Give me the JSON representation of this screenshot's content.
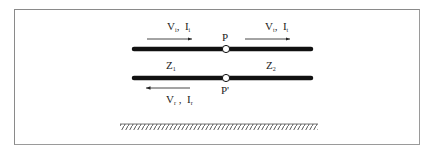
{
  "diagram": {
    "type": "transmission-line junction",
    "node_top": "P",
    "node_bottom": "P'",
    "incident": {
      "voltage": "V",
      "voltage_sub": "i",
      "current": "I",
      "current_sub": "i",
      "direction": "right"
    },
    "transmitted": {
      "voltage": "V",
      "voltage_sub": "t",
      "current": "I",
      "current_sub": "t",
      "direction": "right"
    },
    "reflected": {
      "voltage": "V",
      "voltage_sub": "r",
      "current": "I",
      "current_sub": "r",
      "direction": "left"
    },
    "impedance_left": {
      "symbol": "Z",
      "sub": "1"
    },
    "impedance_right": {
      "symbol": "Z",
      "sub": "2"
    },
    "ground": "hatched ground plane",
    "colors": {
      "conductor": "#111111",
      "border": "#8a8a8a",
      "text": "#222222",
      "node_fill": "#ffffff"
    }
  }
}
